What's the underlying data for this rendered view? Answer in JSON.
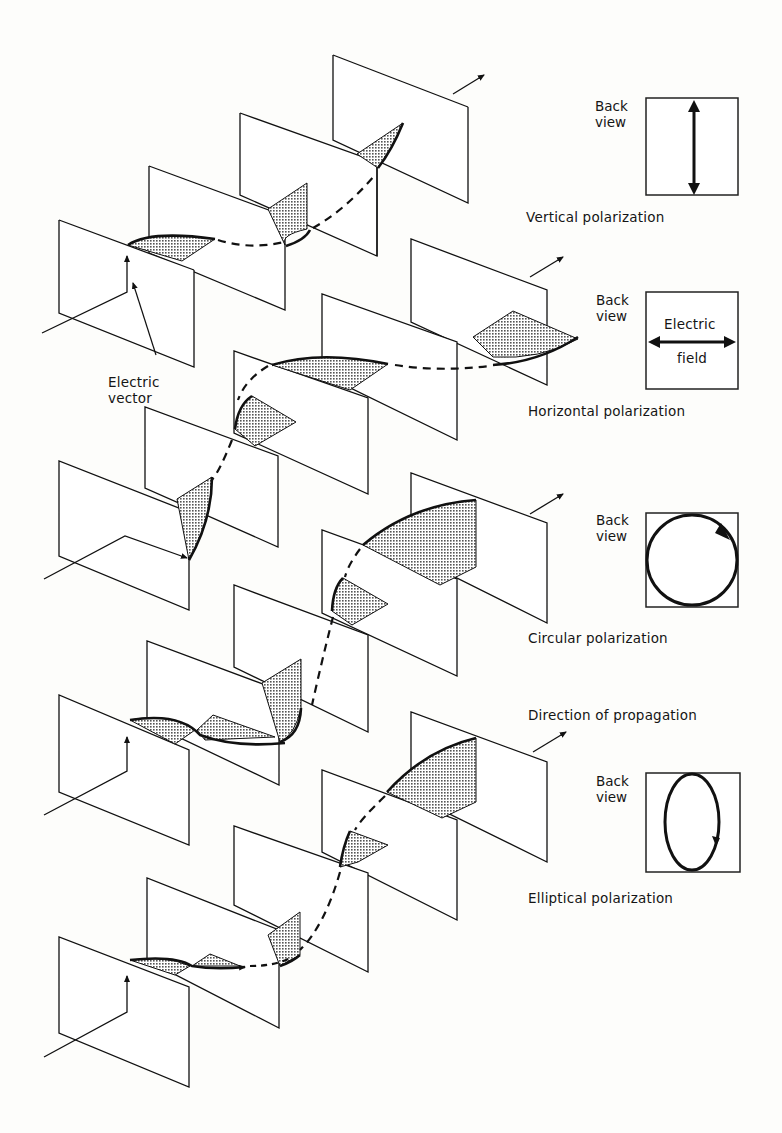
{
  "figure": {
    "type": "polarization-diagram",
    "colors": {
      "ink": "#111111",
      "shade": "#8a8a8a",
      "paper": "#fdfdfb"
    }
  },
  "labels": {
    "electric_vector": [
      "Electric",
      "vector"
    ],
    "back_view": [
      "Back",
      "view"
    ],
    "electric_field": [
      "Electric",
      "field"
    ],
    "direction_of_propagation": "Direction of propagation"
  },
  "panels": [
    {
      "id": "vertical",
      "caption": "Vertical polarization",
      "back_view_icon": "vertical-double-arrow"
    },
    {
      "id": "horizontal",
      "caption": "Horizontal polarization",
      "back_view_icon": "horizontal-double-arrow"
    },
    {
      "id": "circular",
      "caption": "Circular polarization",
      "back_view_icon": "circle-arrow"
    },
    {
      "id": "elliptical",
      "caption": "Elliptical polarization",
      "back_view_icon": "ellipse-arrow"
    }
  ]
}
